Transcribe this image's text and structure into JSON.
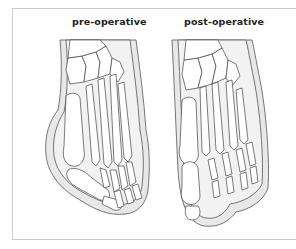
{
  "figure": {
    "panels": [
      {
        "label": "pre-operative",
        "subject": "foot skeleton with hallux valgus (bunion) deformity"
      },
      {
        "label": "post-operative",
        "subject": "foot skeleton with corrected big toe alignment"
      }
    ],
    "colors": {
      "background": "#ffffff",
      "frame": "#c9c9c9",
      "skin_fill": "#e8e8e8",
      "bone_fill": "#ffffff",
      "outline": "#444444",
      "label_text": "#222222"
    }
  }
}
